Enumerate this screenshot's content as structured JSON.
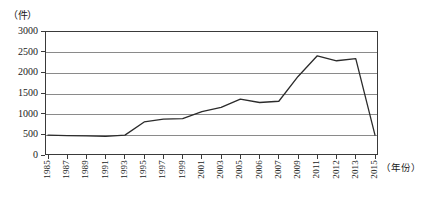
{
  "chart_data": {
    "type": "line",
    "title": "",
    "xlabel": "（年份）",
    "ylabel": "（件）",
    "ylim": [
      0,
      3000
    ],
    "ytick_values": [
      0,
      500,
      1000,
      1500,
      2000,
      2500,
      3000
    ],
    "ytick_labels": [
      "0",
      "500",
      "1000",
      "1500",
      "2000",
      "2500",
      "3000"
    ],
    "grid": true,
    "legend": "none",
    "categories": [
      "1985",
      "1987",
      "1989",
      "1991",
      "1993",
      "1995",
      "1997",
      "1999",
      "2001",
      "2003",
      "2005",
      "2006",
      "2007",
      "2009",
      "2011",
      "2012",
      "2013",
      "2015"
    ],
    "series": [
      {
        "name": "件数",
        "color": "#2b2b2b",
        "values": [
          480,
          470,
          465,
          450,
          480,
          800,
          870,
          880,
          1050,
          1150,
          1350,
          1270,
          1300,
          1900,
          2400,
          2280,
          2330,
          480
        ]
      }
    ]
  },
  "axes": {
    "y_title": "（件）",
    "x_title": "（年份）"
  }
}
